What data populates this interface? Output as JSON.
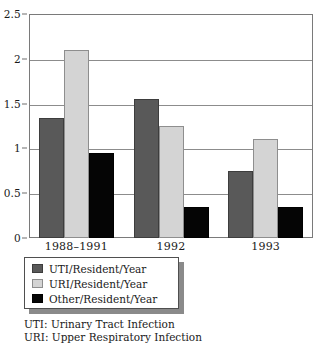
{
  "chart_data": {
    "type": "bar",
    "title": "",
    "subtitle": "",
    "xlabel": "",
    "ylabel": "",
    "categories": [
      "1988–1991",
      "1992",
      "1993"
    ],
    "series": [
      {
        "name": "UTI/Resident/Year",
        "color": "#595959",
        "values": [
          1.34,
          1.55,
          0.75
        ]
      },
      {
        "name": "URI/Resident/Year",
        "color": "#d4d4d4",
        "values": [
          2.1,
          1.25,
          1.1
        ]
      },
      {
        "name": "Other/Resident/Year",
        "color": "#050505",
        "values": [
          0.95,
          0.35,
          0.35
        ]
      }
    ],
    "ylim": [
      0,
      2.5
    ],
    "yticks": [
      0,
      0.5,
      1,
      1.5,
      2,
      2.5
    ],
    "ytick_labels": [
      "0",
      "0.5",
      "1",
      "1.5",
      "2",
      "2.5"
    ],
    "grid": true,
    "grid_axis": "y",
    "legend_position": "below-left",
    "annotations": [
      "UTI: Urinary Tract Infection",
      "URI: Upper Respiratory Infection"
    ]
  },
  "legend": {
    "items": [
      {
        "label": "UTI/Resident/Year",
        "swatch": "legend-swatch-uti"
      },
      {
        "label": "URI/Resident/Year",
        "swatch": "legend-swatch-uri"
      },
      {
        "label": "Other/Resident/Year",
        "swatch": "legend-swatch-other"
      }
    ]
  },
  "footnotes": {
    "line1": "UTI: Urinary Tract Infection",
    "line2": "URI: Upper Respiratory Infection"
  }
}
